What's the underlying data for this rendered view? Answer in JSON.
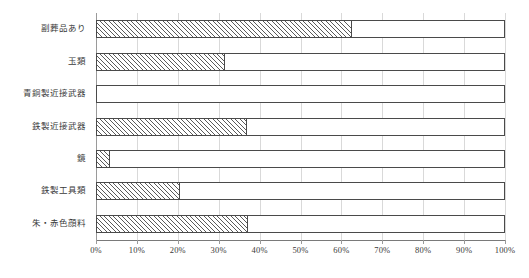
{
  "chart_data": {
    "type": "bar",
    "orientation": "horizontal",
    "title": "",
    "subtitle": "",
    "xlabel": "",
    "ylabel": "",
    "xlim": [
      0,
      100
    ],
    "grid": true,
    "legend": false,
    "legend_position": "none",
    "unit": "%",
    "categories": [
      "副葬品あり",
      "玉類",
      "青銅製近接武器",
      "鉄製近接武器",
      "鏡",
      "鉄製工具類",
      "朱・赤色顔料"
    ],
    "values": [
      62.6,
      31.5,
      0.0,
      36.8,
      3.4,
      20.5,
      37.1
    ],
    "remainder_values": [
      37.4,
      68.5,
      100.0,
      63.2,
      96.6,
      79.5,
      62.9
    ],
    "series": [
      {
        "name": "割合",
        "values": [
          62.6,
          31.5,
          0.0,
          36.8,
          3.4,
          20.5,
          37.1
        ]
      }
    ],
    "xticks": [
      0,
      10,
      20,
      30,
      40,
      50,
      60,
      70,
      80,
      90,
      100
    ],
    "xtick_labels": [
      "0%",
      "10%",
      "20%",
      "30%",
      "40%",
      "50%",
      "60%",
      "70%",
      "80%",
      "90%",
      "100%"
    ]
  },
  "style": {
    "bar_border_color": "#4a4a4a",
    "hatch_color": "#5a5a5a",
    "grid_color": "#d9d9d9",
    "axis_color": "#7a7a7a",
    "text_color": "#3a3a3a",
    "background": "#ffffff"
  }
}
